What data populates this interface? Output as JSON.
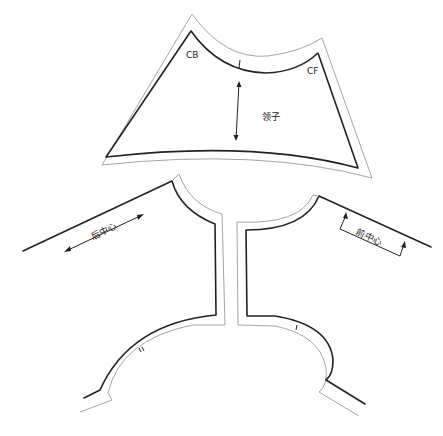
{
  "diagram": {
    "type": "sewing-pattern",
    "pieces": [
      {
        "id": "collar",
        "name": "领子",
        "labels": {
          "left_corner": "CB",
          "right_corner": "CF"
        },
        "notches": [
          "I"
        ],
        "grainline": "vertical double-arrow"
      },
      {
        "id": "back-bodice",
        "name": "后中心",
        "grainline": "diagonal double-arrow along back center"
      },
      {
        "id": "front-bodice",
        "name": "前中心",
        "grainline": "place-on-fold bracket along front center"
      }
    ],
    "armhole_notches": {
      "back": "II",
      "front": "I"
    },
    "colors": {
      "stitch_line": "#222222",
      "cut_line": "#9a9a9a",
      "background": "#ffffff"
    }
  },
  "labels": {
    "collar_name": "领子",
    "cb": "CB",
    "cf": "CF",
    "back_center": "后中心",
    "front_center": "前中心",
    "collar_notch": "I",
    "back_armhole_notch": "II",
    "front_armhole_notch": "I"
  }
}
